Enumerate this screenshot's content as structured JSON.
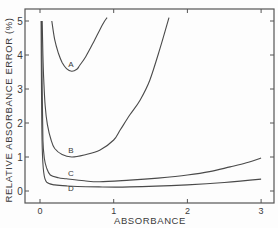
{
  "chart_data": {
    "type": "line",
    "title": "",
    "xlabel": "ABSORBANCE",
    "ylabel": "RELATIVE ABSORBANCE ERROR (%)",
    "xlim": [
      -0.2,
      3.15
    ],
    "ylim": [
      -0.35,
      5.35
    ],
    "xticks": [
      "0",
      "1",
      "2",
      "3"
    ],
    "yticks": [
      "0",
      "1",
      "2",
      "3",
      "4",
      "5"
    ],
    "grid": false,
    "legend": "inline curve labels",
    "series": [
      {
        "name": "A",
        "label_pos": [
          0.42,
          3.65
        ],
        "points": [
          [
            0.16,
            5.0
          ],
          [
            0.2,
            4.45
          ],
          [
            0.25,
            4.05
          ],
          [
            0.3,
            3.78
          ],
          [
            0.36,
            3.6
          ],
          [
            0.43,
            3.52
          ],
          [
            0.5,
            3.58
          ],
          [
            0.54,
            3.7
          ],
          [
            0.62,
            3.95
          ],
          [
            0.72,
            4.35
          ],
          [
            0.85,
            4.9
          ],
          [
            0.91,
            5.1
          ]
        ]
      },
      {
        "name": "B",
        "label_pos": [
          0.42,
          1.12
        ],
        "points": [
          [
            0.03,
            5.0
          ],
          [
            0.04,
            4.0
          ],
          [
            0.05,
            3.3
          ],
          [
            0.07,
            2.5
          ],
          [
            0.1,
            1.95
          ],
          [
            0.15,
            1.5
          ],
          [
            0.2,
            1.25
          ],
          [
            0.3,
            1.07
          ],
          [
            0.43,
            1.0
          ],
          [
            0.6,
            1.06
          ],
          [
            0.81,
            1.2
          ],
          [
            1.0,
            1.5
          ],
          [
            1.09,
            1.8
          ],
          [
            1.22,
            2.24
          ],
          [
            1.36,
            2.68
          ],
          [
            1.49,
            3.26
          ],
          [
            1.63,
            4.2
          ],
          [
            1.75,
            5.1
          ]
        ]
      },
      {
        "name": "C",
        "label_pos": [
          0.42,
          0.45
        ],
        "points": [
          [
            0.02,
            5.0
          ],
          [
            0.03,
            3.0
          ],
          [
            0.04,
            1.5
          ],
          [
            0.06,
            0.95
          ],
          [
            0.09,
            0.68
          ],
          [
            0.14,
            0.47
          ],
          [
            0.25,
            0.39
          ],
          [
            0.36,
            0.36
          ],
          [
            0.6,
            0.3
          ],
          [
            0.81,
            0.27
          ],
          [
            1.22,
            0.32
          ],
          [
            1.6,
            0.38
          ],
          [
            2.0,
            0.47
          ],
          [
            2.3,
            0.57
          ],
          [
            2.58,
            0.71
          ],
          [
            2.8,
            0.83
          ],
          [
            3.0,
            0.97
          ]
        ]
      },
      {
        "name": "D",
        "label_pos": [
          0.42,
          0.0
        ],
        "points": [
          [
            0.015,
            5.0
          ],
          [
            0.02,
            3.0
          ],
          [
            0.03,
            1.3
          ],
          [
            0.05,
            0.55
          ],
          [
            0.09,
            0.26
          ],
          [
            0.2,
            0.18
          ],
          [
            0.36,
            0.15
          ],
          [
            0.8,
            0.12
          ],
          [
            1.22,
            0.12
          ],
          [
            2.0,
            0.18
          ],
          [
            2.5,
            0.25
          ],
          [
            3.0,
            0.35
          ]
        ]
      }
    ]
  }
}
